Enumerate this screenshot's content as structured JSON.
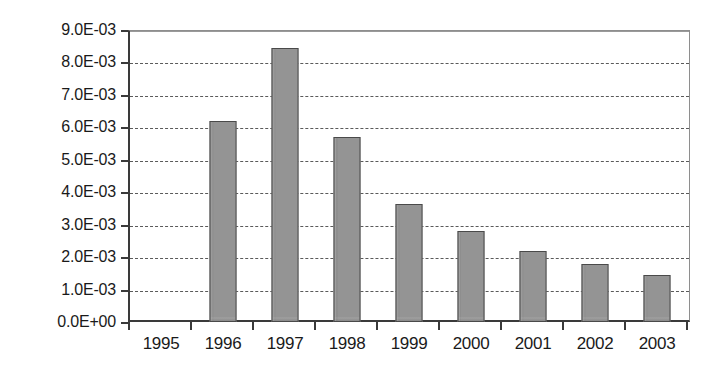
{
  "chart_data": {
    "type": "bar",
    "title": "",
    "subtitle": "",
    "xlabel": "",
    "ylabel": "",
    "categories": [
      "1995",
      "1996",
      "1997",
      "1998",
      "1999",
      "2000",
      "2001",
      "2002",
      "2003"
    ],
    "values": [
      0,
      0.0062,
      0.00845,
      0.0057,
      0.00365,
      0.0028,
      0.0022,
      0.0018,
      0.00145
    ],
    "series": [
      {
        "name": "",
        "values": [
          0,
          0.0062,
          0.00845,
          0.0057,
          0.00365,
          0.0028,
          0.0022,
          0.0018,
          0.00145
        ]
      }
    ],
    "ylim": [
      0,
      0.009
    ],
    "ytick_values": [
      0,
      0.001,
      0.002,
      0.003,
      0.004,
      0.005,
      0.006,
      0.007,
      0.008,
      0.009
    ],
    "ytick_labels": [
      "0.0E+00",
      "1.0E-03",
      "2.0E-03",
      "3.0E-03",
      "4.0E-03",
      "5.0E-03",
      "6.0E-03",
      "7.0E-03",
      "8.0E-03",
      "9.0E-03"
    ],
    "grid": true,
    "grid_style": "dotted-horizontal",
    "legend": false,
    "legend_position": "none",
    "bar_color": "#949494",
    "bar_edge_color": "#4a4a4a",
    "axis_color": "#3a3a3a",
    "grid_color": "#5a5a5a",
    "background_color": "#ffffff",
    "annotations": []
  }
}
